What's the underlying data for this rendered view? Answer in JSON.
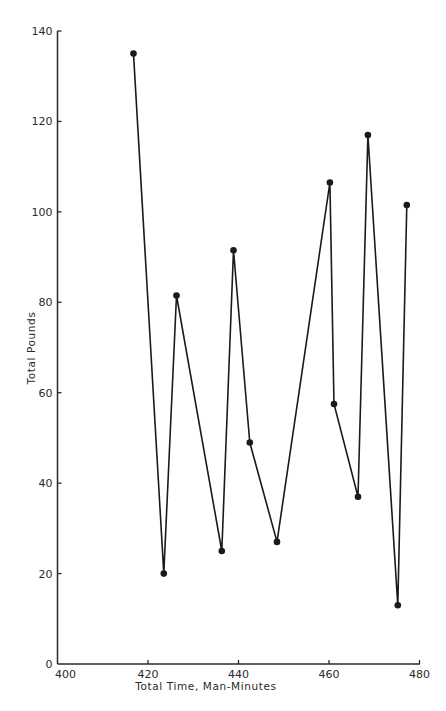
{
  "chart_data": {
    "type": "line",
    "title": "",
    "xlabel": "Total Time, Man-Minutes",
    "ylabel": "Total Pounds",
    "xlim": [
      400,
      480
    ],
    "ylim": [
      0,
      140
    ],
    "x_ticks": [
      400,
      420,
      440,
      460,
      480
    ],
    "y_ticks": [
      0,
      20,
      40,
      60,
      80,
      100,
      120,
      140
    ],
    "grid": false,
    "legend": null,
    "markers": true,
    "series": [
      {
        "name": "Total Pounds vs Total Time",
        "x": [
          416.8,
          423.5,
          426.3,
          436.3,
          438.9,
          442.5,
          448.5,
          460.2,
          461.1,
          466.4,
          468.6,
          475.2,
          477.2
        ],
        "values": [
          135,
          20,
          81.5,
          25,
          91.5,
          49,
          27,
          106.5,
          57.5,
          37,
          117,
          13,
          101.5
        ]
      }
    ]
  },
  "labels": {
    "xlabel": "Total Time, Man-Minutes",
    "ylabel": "Total Pounds",
    "x_ticks": [
      "400",
      "420",
      "440",
      "460",
      "480"
    ],
    "y_ticks": [
      "0",
      "20",
      "40",
      "60",
      "80",
      "100",
      "120",
      "140"
    ]
  }
}
